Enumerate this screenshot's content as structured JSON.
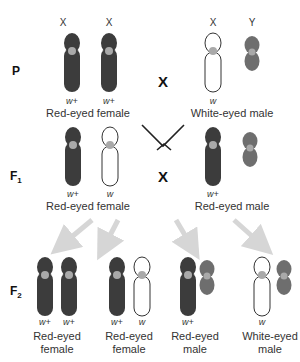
{
  "rows": {
    "p": {
      "label": "P"
    },
    "f1": {
      "label": "F",
      "sub": "1"
    },
    "f2": {
      "label": "F",
      "sub": "2"
    }
  },
  "cross_symbol": "X",
  "colors": {
    "dark_chromosome": "#3c3c3c",
    "y_chromosome": "#6e6e6e",
    "centromere": "#a9a9a9",
    "white_chromosome": "#ffffff",
    "arrow_fill": "#d6d6d6"
  },
  "p": {
    "female": {
      "chromosome_labels": [
        "X",
        "X"
      ],
      "alleles": [
        "w+",
        "w+"
      ],
      "phenotype": "Red-eyed female"
    },
    "male": {
      "chromosome_labels": [
        "X",
        "Y"
      ],
      "alleles": [
        "w"
      ],
      "phenotype": "White-eyed male"
    }
  },
  "f1": {
    "female": {
      "alleles": [
        "w+",
        "w"
      ],
      "phenotype": "Red-eyed female"
    },
    "male": {
      "alleles": [
        "w+"
      ],
      "phenotype": "Red-eyed male"
    }
  },
  "f2": [
    {
      "alleles": [
        "w+",
        "w+"
      ],
      "phenotype_line1": "Red-eyed",
      "phenotype_line2": "female"
    },
    {
      "alleles": [
        "w+",
        "w"
      ],
      "phenotype_line1": "Red-eyed",
      "phenotype_line2": "female"
    },
    {
      "alleles": [
        "w+"
      ],
      "phenotype_line1": "Red-eyed",
      "phenotype_line2": "male"
    },
    {
      "alleles": [
        "w"
      ],
      "phenotype_line1": "White-eyed",
      "phenotype_line2": "male"
    }
  ]
}
